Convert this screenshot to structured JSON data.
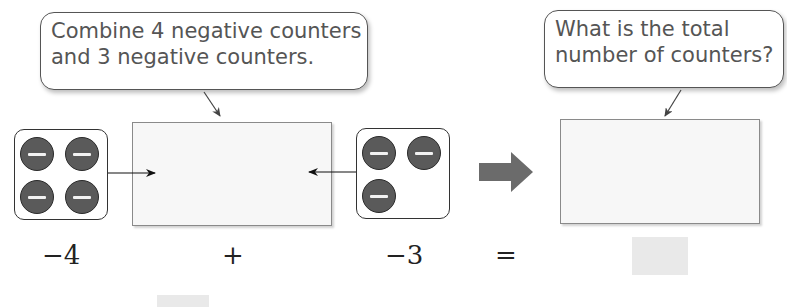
{
  "callouts": {
    "left": {
      "line1": "Combine 4 negative counters",
      "line2": "and 3 negative counters."
    },
    "right": {
      "line1": "What is the total",
      "line2": "number of counters?"
    }
  },
  "equation": {
    "term1": "−4",
    "operator": "+",
    "term2": "−3",
    "equals": "="
  },
  "counter_groups": {
    "left": {
      "count": 4,
      "sign": "negative"
    },
    "right": {
      "count": 3,
      "sign": "negative"
    }
  },
  "icons": {
    "counter": "negative-counter-icon",
    "result_arrow": "block-arrow-right-icon"
  },
  "colors": {
    "counter_fill": "#5a5a5a",
    "arrow_fill": "#6b6b6b",
    "mat_fill": "#f7f7f7",
    "answer_fill": "#e9e9e9"
  }
}
